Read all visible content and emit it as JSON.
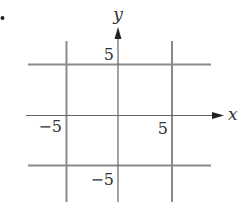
{
  "diagram": {
    "type": "coordinate-plane",
    "axes": {
      "x_label": "x",
      "y_label": "y"
    },
    "tick_labels": {
      "y_pos": "5",
      "y_neg": "−5",
      "x_pos": "5",
      "x_neg": "−5"
    },
    "lines": [
      {
        "equation": "x = -5",
        "orientation": "vertical"
      },
      {
        "equation": "x = 5",
        "orientation": "vertical"
      },
      {
        "equation": "y = 5",
        "orientation": "horizontal"
      },
      {
        "equation": "y = -5",
        "orientation": "horizontal"
      }
    ],
    "colors": {
      "grid_lines": "#8a8a8a",
      "axes": "#555555",
      "text": "#333333"
    }
  }
}
